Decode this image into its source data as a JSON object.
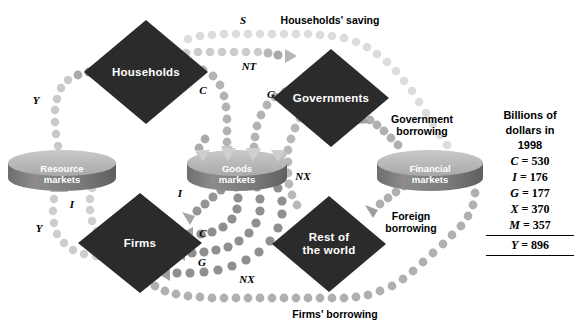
{
  "diagram": {
    "sectors": [
      {
        "id": "households",
        "label": "Households",
        "cx": 146,
        "cy": 72,
        "rx": 62,
        "ry": 52
      },
      {
        "id": "governments",
        "label": "Governments",
        "cx": 331,
        "cy": 98,
        "rx": 58,
        "ry": 49
      },
      {
        "id": "firms",
        "label": "Firms",
        "cx": 140,
        "cy": 243,
        "rx": 62,
        "ry": 50
      },
      {
        "id": "rest-of-world",
        "label_line1": "Rest of",
        "label_line2": "the world",
        "cx": 329,
        "cy": 244,
        "rx": 57,
        "ry": 48
      }
    ],
    "markets": [
      {
        "id": "resource-markets",
        "line1": "Resource",
        "line2": "markets",
        "cx": 62,
        "cy": 163,
        "rx": 54,
        "ry": 13,
        "h": 30
      },
      {
        "id": "goods-markets",
        "line1": "Goods",
        "line2": "markets",
        "cx": 237,
        "cy": 163,
        "rx": 50,
        "ry": 13,
        "h": 30
      },
      {
        "id": "financial-markets",
        "line1": "Financial",
        "line2": "markets",
        "cx": 430,
        "cy": 163,
        "rx": 53,
        "ry": 13,
        "h": 30
      }
    ],
    "flow_letters": [
      {
        "id": "y-top",
        "text": "Y",
        "x": 36,
        "y": 100
      },
      {
        "id": "y-bottom",
        "text": "Y",
        "x": 39,
        "y": 228
      },
      {
        "id": "s",
        "text": "S",
        "x": 243,
        "y": 20
      },
      {
        "id": "nt",
        "text": "NT",
        "x": 249,
        "y": 66
      },
      {
        "id": "c-top",
        "text": "C",
        "x": 203,
        "y": 90
      },
      {
        "id": "g-top",
        "text": "G",
        "x": 271,
        "y": 94
      },
      {
        "id": "i-left",
        "text": "I",
        "x": 72,
        "y": 204
      },
      {
        "id": "i-right",
        "text": "I",
        "x": 180,
        "y": 193
      },
      {
        "id": "c-bottom",
        "text": "C",
        "x": 203,
        "y": 233
      },
      {
        "id": "g-bottom",
        "text": "G",
        "x": 202,
        "y": 262
      },
      {
        "id": "nx-right",
        "text": "NX",
        "x": 303,
        "y": 176
      },
      {
        "id": "nx-bottom",
        "text": "NX",
        "x": 247,
        "y": 279
      }
    ],
    "flow_captions": [
      {
        "id": "households-saving",
        "text": "Households' saving",
        "x": 330,
        "y": 20
      },
      {
        "id": "government-borrowing-1",
        "text": "Government",
        "x": 422,
        "y": 119
      },
      {
        "id": "government-borrowing-2",
        "text": "borrowing",
        "x": 422,
        "y": 131
      },
      {
        "id": "foreign-borrowing-1",
        "text": "Foreign",
        "x": 411,
        "y": 216
      },
      {
        "id": "foreign-borrowing-2",
        "text": "borrowing",
        "x": 411,
        "y": 228
      },
      {
        "id": "firms-borrowing",
        "text": "Firms' borrowing",
        "x": 335,
        "y": 314
      }
    ],
    "colors": {
      "sector_fill": "#2b2b2b",
      "cylinder_top": "#b6b6b6",
      "cylinder_body": "#7a7a7a",
      "dots_light": "#d2d2d2",
      "dots_mid": "#b0b0b0",
      "dots_dark": "#8d8d8d",
      "dots_darkest": "#6f6f6f",
      "text": "#000000"
    }
  },
  "legend": {
    "heading_line1": "Billions of",
    "heading_line2": "dollars in",
    "heading_line3": "1998",
    "rows": [
      {
        "symbol": "C",
        "eq": "=",
        "value": "530"
      },
      {
        "symbol": "I",
        "eq": "=",
        "value": "176"
      },
      {
        "symbol": "G",
        "eq": "=",
        "value": "177"
      },
      {
        "symbol": "X",
        "eq": "=",
        "value": "370"
      },
      {
        "symbol": "M",
        "eq": "=",
        "value": "357"
      }
    ],
    "total": {
      "symbol": "Y",
      "eq": "=",
      "value": "896"
    }
  }
}
